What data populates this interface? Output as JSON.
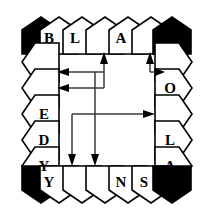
{
  "figure": {
    "type": "pentagon-ring-diagram",
    "colors": {
      "stroke": "#000000",
      "fill": "#ffffff",
      "corner_fill": "#000000",
      "arrow": "#2b2b2b",
      "background": "#ffffff"
    }
  },
  "ring": {
    "top": [
      {
        "id": "corner-top-left",
        "letter": "",
        "filled": true
      },
      {
        "id": "top-1",
        "letter": "B",
        "filled": false
      },
      {
        "id": "top-2",
        "letter": "L",
        "filled": false
      },
      {
        "id": "top-3",
        "letter": "",
        "filled": false
      },
      {
        "id": "top-4",
        "letter": "A",
        "filled": false
      },
      {
        "id": "top-5",
        "letter": "",
        "filled": false
      },
      {
        "id": "corner-top-right",
        "letter": "",
        "filled": true
      }
    ],
    "right": [
      {
        "id": "right-1",
        "letter": "",
        "filled": false
      },
      {
        "id": "right-2",
        "letter": "O",
        "filled": false
      },
      {
        "id": "right-3",
        "letter": "",
        "filled": false
      },
      {
        "id": "right-4",
        "letter": "L",
        "filled": false
      },
      {
        "id": "right-5",
        "letter": "A",
        "filled": false
      }
    ],
    "bottom": [
      {
        "id": "corner-bottom-left",
        "letter": "",
        "filled": true
      },
      {
        "id": "bottom-1",
        "letter": "Y",
        "filled": false
      },
      {
        "id": "bottom-2",
        "letter": "",
        "filled": false
      },
      {
        "id": "bottom-3",
        "letter": "",
        "filled": false
      },
      {
        "id": "bottom-4",
        "letter": "N",
        "filled": false
      },
      {
        "id": "bottom-5",
        "letter": "S",
        "filled": false
      },
      {
        "id": "corner-bottom-right",
        "letter": "",
        "filled": true
      }
    ],
    "left": [
      {
        "id": "left-1",
        "letter": "",
        "filled": false
      },
      {
        "id": "left-2",
        "letter": "",
        "filled": false
      },
      {
        "id": "left-3",
        "letter": "E",
        "filled": false
      },
      {
        "id": "left-4",
        "letter": "D",
        "filled": false
      },
      {
        "id": "left-5",
        "letter": "Y",
        "filled": false
      }
    ]
  },
  "letters_clockwise_from_top_left": [
    "B",
    "L",
    "A",
    "O",
    "L",
    "A",
    "S",
    "N",
    "Y",
    "Y",
    "D",
    "E"
  ],
  "arrows": [
    {
      "id": "arrow-left-upper",
      "direction": "left",
      "label": "upper left-pointing arrow"
    },
    {
      "id": "arrow-left-lower",
      "direction": "left",
      "label": "lower left-pointing arrow"
    },
    {
      "id": "arrow-up-center",
      "direction": "up",
      "label": "upward arrow into top row"
    },
    {
      "id": "arrow-up-right",
      "direction": "up",
      "label": "short upward arrow near top right"
    },
    {
      "id": "arrow-right-small",
      "direction": "right",
      "label": "short right hook arrow near top right"
    },
    {
      "id": "arrow-right-mid",
      "direction": "right",
      "label": "long right-pointing arrow at mid height"
    },
    {
      "id": "arrow-down-left",
      "direction": "down",
      "label": "left downward arrow into bottom row"
    },
    {
      "id": "arrow-down-right",
      "direction": "down",
      "label": "right downward arrow into bottom row"
    }
  ]
}
